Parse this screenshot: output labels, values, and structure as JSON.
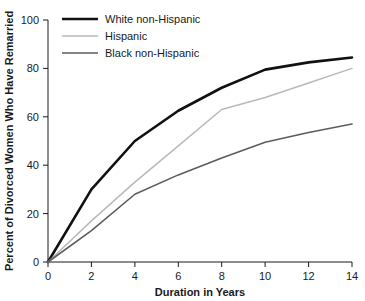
{
  "chart_data": {
    "type": "line",
    "title": "",
    "xlabel": "Duration in Years",
    "ylabel": "Percent of Divorced Women Who Have Remarried",
    "xlim": [
      0,
      14
    ],
    "ylim": [
      0,
      100
    ],
    "xticks": [
      "0",
      "2",
      "4",
      "6",
      "8",
      "10",
      "12",
      "14"
    ],
    "yticks": [
      "0",
      "20",
      "40",
      "60",
      "80",
      "100"
    ],
    "grid": false,
    "legend_position": "top-left",
    "x": [
      0,
      2,
      4,
      6,
      8,
      10,
      12,
      14
    ],
    "series": [
      {
        "name": "White non-Hispanic",
        "color": "#111111",
        "width": 2.6,
        "values": [
          0,
          30,
          50,
          62.5,
          72,
          79.5,
          82.5,
          84.5
        ]
      },
      {
        "name": "Hispanic",
        "color": "#b9b9b9",
        "width": 1.5,
        "values": [
          0,
          17,
          33,
          48,
          63,
          68,
          74,
          80
        ]
      },
      {
        "name": "Black non-Hispanic",
        "color": "#5c5c5c",
        "width": 1.6,
        "values": [
          0,
          13,
          28,
          36,
          43,
          49.5,
          53.5,
          57
        ]
      }
    ]
  },
  "axes": {
    "x_tick_labels": [
      "0",
      "2",
      "4",
      "6",
      "8",
      "10",
      "12",
      "14"
    ],
    "y_tick_labels": [
      "0",
      "20",
      "40",
      "60",
      "80",
      "100"
    ],
    "x_axis_title": "Duration in Years",
    "y_axis_title": "Percent of Divorced Women Who Have Remarried"
  },
  "legend": {
    "items": [
      {
        "label": "White non-Hispanic",
        "color": "#111111",
        "width": 2.6
      },
      {
        "label": "Hispanic",
        "color": "#b9b9b9",
        "width": 1.5
      },
      {
        "label": "Black non-Hispanic",
        "color": "#5c5c5c",
        "width": 1.6
      }
    ]
  }
}
